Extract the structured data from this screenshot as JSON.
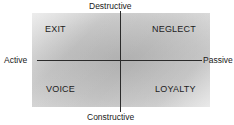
{
  "diagram": {
    "axes": {
      "horizontal": {
        "left_label": "Active",
        "right_label": "Passive"
      },
      "vertical": {
        "top_label": "Destructive",
        "bottom_label": "Constructive"
      }
    },
    "quadrants": [
      {
        "id": "top-left",
        "label": "EXIT"
      },
      {
        "id": "top-right",
        "label": "NEGLECT"
      },
      {
        "id": "bottom-left",
        "label": "VOICE"
      },
      {
        "id": "bottom-right",
        "label": "LOYALTY"
      }
    ],
    "colors": {
      "plate_light": "#e9e9e9",
      "plate_mid": "#c6c6c6",
      "axis_line": "#2b2b2b",
      "text": "#1c1c1c",
      "background": "#ffffff"
    }
  }
}
